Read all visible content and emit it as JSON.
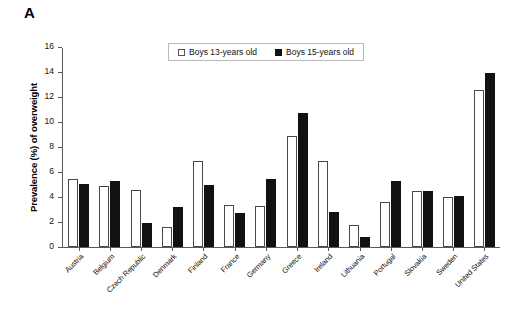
{
  "panel": {
    "label": "A"
  },
  "legend": {
    "position": "top-center",
    "entries": [
      {
        "label": "Boys 13-years old",
        "swatch": "open-square",
        "color": "#ffffff"
      },
      {
        "label": "Boys 15-years old",
        "swatch": "filled-square",
        "color": "#111111"
      }
    ]
  },
  "axes": {
    "y_title": "Prevalence (%) of overweight",
    "y_ticks": [
      0,
      2,
      4,
      6,
      8,
      10,
      12,
      14,
      16
    ]
  },
  "chart_data": {
    "type": "bar",
    "title": "",
    "xlabel": "",
    "ylabel": "Prevalence (%) of overweight",
    "ylim": [
      0,
      16
    ],
    "ytick_step": 2,
    "grid": false,
    "legend_position": "top-center",
    "categories": [
      "Austria",
      "Belgium",
      "Czech Republic",
      "Denmark",
      "Finland",
      "France",
      "Germany",
      "Greece",
      "Ireland",
      "Lithuania",
      "Portugal",
      "Slovakia",
      "Sweden",
      "United States"
    ],
    "series": [
      {
        "name": "Boys 13-years old",
        "color": "#ffffff",
        "values": [
          5.5,
          4.9,
          4.6,
          1.6,
          6.9,
          3.4,
          3.3,
          8.9,
          6.9,
          1.8,
          3.6,
          4.5,
          4.0,
          12.6
        ]
      },
      {
        "name": "Boys 15-years old",
        "color": "#111111",
        "values": [
          5.1,
          5.3,
          1.9,
          3.2,
          5.0,
          2.7,
          5.5,
          10.8,
          2.8,
          0.8,
          5.3,
          4.5,
          4.1,
          14.0
        ]
      }
    ]
  }
}
